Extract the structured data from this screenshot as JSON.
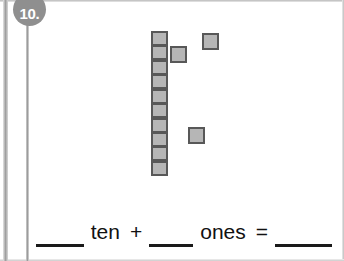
{
  "worksheet": {
    "problem_number": "10.",
    "badge_color": "#8f8f8f",
    "block_fill_color": "#b6b6b6",
    "block_border_color": "#585858"
  },
  "manipulatives": {
    "ten_rod": {
      "label": "ten-rod",
      "count": 1,
      "units_in_rod": 10,
      "unit_positions_y": [
        31,
        45,
        60,
        74,
        89,
        103,
        118,
        132,
        146,
        161
      ],
      "x": 151,
      "unit_width": 17,
      "unit_height": 15
    },
    "single_units": [
      {
        "label": "one-unit",
        "x": 170,
        "y": 46,
        "size": 17
      },
      {
        "label": "one-unit",
        "x": 202,
        "y": 33,
        "size": 17
      },
      {
        "label": "one-unit",
        "x": 188,
        "y": 127,
        "size": 17
      }
    ],
    "ones_count": 3
  },
  "equation": {
    "blank_tens_value": "",
    "word_ten": "ten",
    "operator_plus": "+",
    "blank_ones_value": "",
    "word_ones": "ones",
    "operator_equals": "=",
    "blank_total_value": ""
  }
}
